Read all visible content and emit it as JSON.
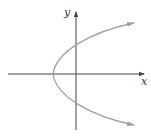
{
  "diagram": {
    "type": "parabola-graph",
    "axes": {
      "x_label": "x",
      "y_label": "y"
    },
    "colors": {
      "axis": "#444444",
      "curve": "#a0a0a0"
    }
  }
}
